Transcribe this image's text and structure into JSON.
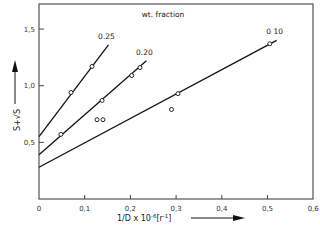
{
  "chart_data": {
    "type": "scatter",
    "title": "",
    "legend_title": "wt. fraction",
    "xlabel": "1/D x 10^-6 [r^-1]",
    "xlabel_display": "1/D x 10",
    "xlabel_exp": "-6",
    "xlabel_unit": "[r",
    "xlabel_unit_exp": "-1",
    "xlabel_unit_close": "]",
    "ylabel": "S + √S",
    "ylabel_display": "S+√S",
    "xlim": [
      0,
      0.6
    ],
    "ylim": [
      0,
      1.7
    ],
    "x_ticks": [
      0,
      0.1,
      0.2,
      0.3,
      0.4,
      0.5,
      0.6
    ],
    "x_tick_labels": [
      "0",
      "0,1",
      "0,2",
      "0,3",
      "0,4",
      "0,5",
      "0,6"
    ],
    "y_ticks": [
      0.5,
      1.0,
      1.5
    ],
    "y_tick_labels": [
      "0,5",
      "1,0",
      "1,5"
    ],
    "grid": false,
    "legend_position": "top-center",
    "series": [
      {
        "name": "0.25",
        "label": "0.25",
        "points": [
          [
            0.07,
            0.94
          ],
          [
            0.116,
            1.17
          ]
        ],
        "fit_line": {
          "x0": 0,
          "y0": 0.55,
          "x1": 0.152,
          "y1": 1.36
        }
      },
      {
        "name": "0.20",
        "label": "0.20",
        "points": [
          [
            0.048,
            0.57
          ],
          [
            0.138,
            0.87
          ],
          [
            0.203,
            1.09
          ],
          [
            0.221,
            1.16
          ]
        ],
        "fit_line": {
          "x0": 0,
          "y0": 0.39,
          "x1": 0.235,
          "y1": 1.22
        }
      },
      {
        "name": "0.10",
        "label": "0 10",
        "points": [
          [
            0.304,
            0.93
          ],
          [
            0.505,
            1.37
          ]
        ],
        "fit_line": {
          "x0": 0,
          "y0": 0.28,
          "x1": 0.52,
          "y1": 1.4
        }
      }
    ],
    "unassigned_points": [
      [
        0.127,
        0.7
      ],
      [
        0.14,
        0.7
      ],
      [
        0.29,
        0.79
      ]
    ]
  }
}
